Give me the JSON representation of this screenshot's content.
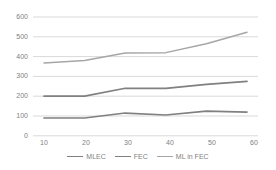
{
  "chart_data": {
    "type": "line",
    "title": "",
    "xlabel": "",
    "ylabel": "",
    "x": [
      10,
      20,
      30,
      40,
      50,
      60
    ],
    "xtick_labels": [
      "10",
      "20",
      "30",
      "40",
      "50",
      "60"
    ],
    "ytick_labels": [
      "0",
      "100",
      "200",
      "300",
      "400",
      "500",
      "600"
    ],
    "yticks": [
      0,
      100,
      200,
      300,
      400,
      500,
      600
    ],
    "ylim": [
      0,
      600
    ],
    "xlim": [
      10,
      60
    ],
    "grid": "horizontal",
    "legend_position": "bottom",
    "series": [
      {
        "name": "MLEC",
        "color": "#808080",
        "values": [
          90,
          90,
          115,
          105,
          125,
          120
        ]
      },
      {
        "name": "FEC",
        "color": "#808080",
        "values": [
          200,
          200,
          240,
          240,
          260,
          275
        ]
      },
      {
        "name": "ML in FEC",
        "color": "#a6a6a6",
        "values": [
          368,
          380,
          418,
          420,
          465,
          523
        ]
      }
    ]
  },
  "colors": {
    "background": "#ffffff",
    "gridline": "#d9d9d9",
    "tick_text": "#7f7f7f",
    "series_dark": "#808080",
    "series_light": "#a6a6a6"
  }
}
